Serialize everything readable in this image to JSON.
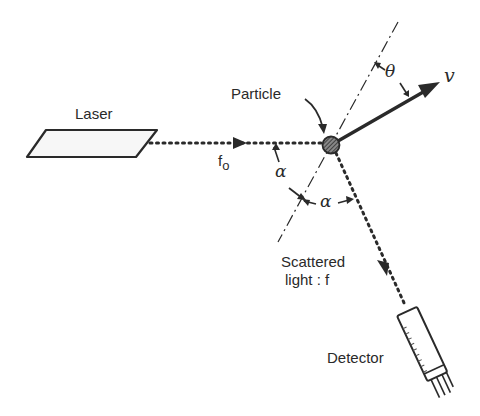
{
  "diagram": {
    "type": "laser-doppler-scattering-schematic",
    "labels": {
      "laser": "Laser",
      "particle": "Particle",
      "incident_frequency": "f",
      "incident_frequency_subscript": "o",
      "velocity": "v",
      "theta": "θ",
      "alpha_left": "α",
      "alpha_right": "α",
      "scattered_line1": "Scattered",
      "scattered_line2": "light : f",
      "detector": "Detector"
    },
    "colors": {
      "ink": "#2a2a2a",
      "background": "#ffffff",
      "particle_fill": "#555555"
    },
    "nodes": [
      {
        "id": "laser",
        "label": "Laser"
      },
      {
        "id": "particle",
        "label": "Particle"
      },
      {
        "id": "detector",
        "label": "Detector"
      }
    ],
    "edges": [
      {
        "from": "laser",
        "to": "particle",
        "style": "dotted-arrow",
        "label": "f_o"
      },
      {
        "from": "particle",
        "to": "detector",
        "style": "dotted-arrow",
        "label": "Scattered light : f"
      },
      {
        "from": "particle",
        "to": "velocity",
        "style": "solid-arrow",
        "label": "v"
      }
    ],
    "angles": [
      {
        "name": "theta",
        "between": [
          "bisector",
          "velocity"
        ]
      },
      {
        "name": "alpha",
        "between": [
          "incident-beam",
          "bisector"
        ]
      },
      {
        "name": "alpha",
        "between": [
          "bisector-normal",
          "scattered-beam"
        ]
      }
    ]
  }
}
